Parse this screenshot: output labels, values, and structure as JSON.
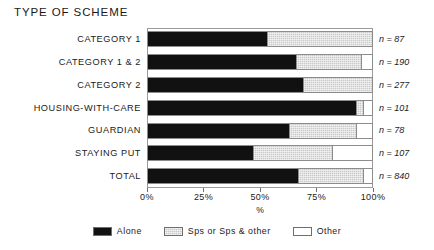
{
  "chart_data": {
    "type": "bar",
    "orientation": "horizontal",
    "stacked": true,
    "stacked_normalized": true,
    "title": "TYPE OF SCHEME",
    "xlabel": "%",
    "ylabel": "",
    "xlim": [
      0,
      100
    ],
    "grid": false,
    "legend_position": "bottom",
    "categories": [
      "CATEGORY 1",
      "CATEGORY 1 & 2",
      "CATEGORY 2",
      "HOUSING-WITH-CARE",
      "GUARDIAN",
      "STAYING PUT",
      "TOTAL"
    ],
    "tick_labels": [
      "0%",
      "25%",
      "50%",
      "75%",
      "100%"
    ],
    "tick_values": [
      0,
      25,
      50,
      75,
      100
    ],
    "series": [
      {
        "name": "Alone",
        "color": "#111111",
        "values": [
          53,
          66,
          69,
          93,
          63,
          47,
          67
        ]
      },
      {
        "name": "Sps or Sps & other",
        "color": "#c9c9c9",
        "values": [
          47,
          29,
          31,
          3,
          30,
          35,
          29
        ]
      },
      {
        "name": "Other",
        "color": "#ffffff",
        "values": [
          0,
          5,
          0,
          4,
          7,
          18,
          4
        ]
      }
    ],
    "annotations": [
      "n = 87",
      "n = 190",
      "n = 277",
      "n = 101",
      "n = 78",
      "n = 107",
      "n = 840"
    ],
    "sample_sizes": [
      87,
      190,
      277,
      101,
      78,
      107,
      840
    ]
  }
}
